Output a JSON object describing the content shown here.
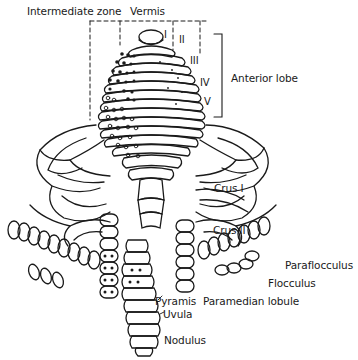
{
  "figure": {
    "labels": {
      "intermediate_zone": "Intermediate zone",
      "vermis": "Vermis",
      "lobule_I": "I",
      "lobule_II": "II",
      "lobule_III": "III",
      "lobule_IV": "IV",
      "lobule_V": "V",
      "anterior_lobe": "Anterior lobe",
      "crus_I": "Crus I",
      "crus_II": "Crus II",
      "paraflocculus": "Paraflocculus",
      "flocculus": "Flocculus",
      "pyramis": "Pyramis",
      "paramedian_lobule": "Paramedian lobule",
      "uvula": "Uvula",
      "nodulus": "Nodulus"
    },
    "colors": {
      "line": "#1a1a1a",
      "background": "#ffffff"
    }
  }
}
